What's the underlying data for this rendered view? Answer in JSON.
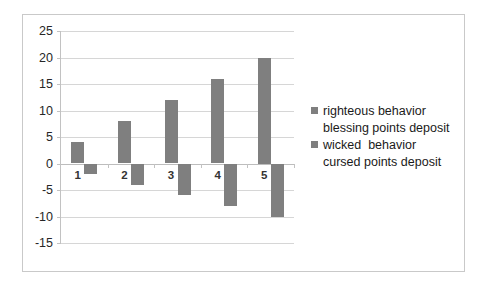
{
  "chart_data": {
    "type": "bar",
    "title": "",
    "subtitle": "",
    "xlabel": "",
    "ylabel": "",
    "categories": [
      "1",
      "2",
      "3",
      "4",
      "5"
    ],
    "series": [
      {
        "name": "righteous behavior\nblessing points deposit",
        "values": [
          4,
          8,
          12,
          16,
          20
        ],
        "color": "#7f7f7f"
      },
      {
        "name": "wicked  behavior\ncursed points deposit",
        "values": [
          -2,
          -4,
          -6,
          -8,
          -10
        ],
        "color": "#7f7f7f"
      }
    ],
    "ylim": [
      -15,
      25
    ],
    "yticks": [
      25,
      20,
      15,
      10,
      5,
      0,
      -5,
      -10,
      -15
    ],
    "ytick_labels": [
      "25",
      "20",
      "15",
      "10",
      "5",
      "0",
      "-5",
      "-10",
      "-15"
    ],
    "grid": true,
    "grid_axis": "y",
    "legend_position": "right",
    "plot_background": "#ffffff",
    "gridline_color": "#d6d6d6",
    "border_color": "#c9c9c9"
  },
  "legend": {
    "entries": [
      {
        "label": "righteous behavior",
        "sublabel": "blessing points deposit",
        "swatch_color": "#7f7f7f"
      },
      {
        "label": "wicked  behavior",
        "sublabel": "cursed points deposit",
        "swatch_color": "#7f7f7f"
      }
    ]
  }
}
